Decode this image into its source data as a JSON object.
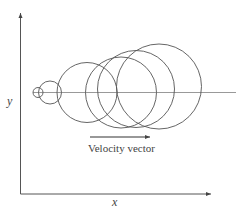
{
  "axes": {
    "x_label": "x",
    "y_label": "y",
    "origin": [
      20.5,
      194
    ],
    "y_axis_top": 13,
    "x_axis_right": 211,
    "color": "#555555"
  },
  "baseline": {
    "y": 92.5,
    "x1": 33,
    "x2": 236,
    "color": "#999999"
  },
  "circles": [
    {
      "cx": 38,
      "cy": 92.5,
      "r": 5
    },
    {
      "cx": 50,
      "cy": 92.5,
      "r": 11.5
    },
    {
      "cx": 87,
      "cy": 92.5,
      "r": 30
    },
    {
      "cx": 121,
      "cy": 92.5,
      "r": 35.5
    },
    {
      "cx": 136,
      "cy": 89,
      "r": 38.5
    },
    {
      "cx": 159,
      "cy": 86.5,
      "r": 42.5
    }
  ],
  "circle_color": "#555555",
  "velocity": {
    "label": "Velocity vector",
    "arrow": {
      "x1": 90,
      "x2": 150,
      "y": 137
    }
  }
}
